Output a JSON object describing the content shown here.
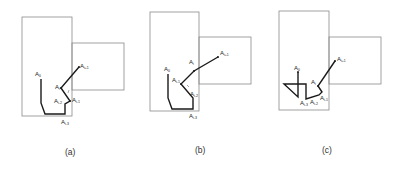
{
  "figure": {
    "panels": [
      {
        "id": "a",
        "caption": "(a)",
        "labels": {
          "a0": "A",
          "a0_sub": "0",
          "ai": "A",
          "ai_sub": "i",
          "ai1": "A",
          "ai1_sub": "i+1",
          "aim1": "A",
          "aim1_sub": "i-1",
          "aim2": "A",
          "aim2_sub": "i-2",
          "aim3": "A",
          "aim3_sub": "i-3"
        }
      },
      {
        "id": "b",
        "caption": "(b)",
        "labels": {
          "a0": "A",
          "a0_sub": "0",
          "ai": "A",
          "ai_sub": "i",
          "ai1": "A",
          "ai1_sub": "i+1",
          "aim1": "A",
          "aim1_sub": "i-1",
          "aim2": "A",
          "aim2_sub": "i-2",
          "aim3": "A",
          "aim3_sub": "i-3"
        }
      },
      {
        "id": "c",
        "caption": "(c)",
        "labels": {
          "a0": "A",
          "a0_sub": "0",
          "ai": "A",
          "ai_sub": "i",
          "ai1": "A",
          "ai1_sub": "i+1",
          "aim1": "A",
          "aim1_sub": "i-1",
          "aim2": "A",
          "aim2_sub": "i-2",
          "aim3": "A",
          "aim3_sub": "i-3"
        }
      }
    ]
  }
}
